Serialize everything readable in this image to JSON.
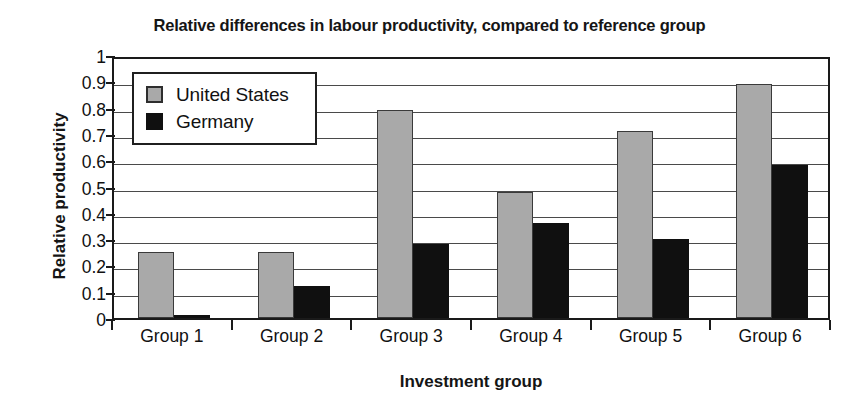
{
  "chart_data": {
    "type": "bar",
    "title": "Relative differences in labour productivity, compared to reference group",
    "xlabel": "Investment group",
    "ylabel": "Relative productivity",
    "categories": [
      "Group 1",
      "Group 2",
      "Group 3",
      "Group 4",
      "Group 5",
      "Group 6"
    ],
    "series": [
      {
        "name": "United States",
        "color": "#a9a9a9",
        "values": [
          0.25,
          0.25,
          0.79,
          0.48,
          0.71,
          0.89
        ]
      },
      {
        "name": "Germany",
        "color": "#101010",
        "values": [
          0.01,
          0.12,
          0.28,
          0.36,
          0.3,
          0.58
        ]
      }
    ],
    "ylim": [
      0,
      1
    ],
    "ytick_labels": [
      "1",
      "0.9",
      "0.8",
      "0.7",
      "0.6",
      "0.5",
      "0.4",
      "0.3",
      "0.2",
      "0.1",
      "0"
    ],
    "ytick_values": [
      1,
      0.9,
      0.8,
      0.7,
      0.6,
      0.5,
      0.4,
      0.3,
      0.2,
      0.1,
      0
    ],
    "grid": "horizontal",
    "legend_position": "top-left-inside"
  }
}
